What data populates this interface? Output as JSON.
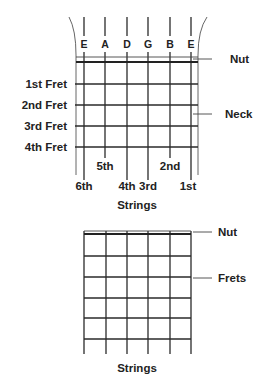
{
  "colors": {
    "line": "#2a2a2a",
    "text": "#222222",
    "background": "#ffffff"
  },
  "diagram1": {
    "string_names": [
      "E",
      "A",
      "D",
      "G",
      "B",
      "E"
    ],
    "string_x": [
      84,
      105,
      127,
      148,
      170,
      191
    ],
    "string_top": 17,
    "string_bottom": [
      180,
      158,
      180,
      180,
      158,
      180
    ],
    "neck_left": 76,
    "neck_right": 198,
    "neck_bottom": 175,
    "nut_y": [
      57,
      62
    ],
    "frets": [
      {
        "label": "1st Fret",
        "y": 84
      },
      {
        "label": "2nd Fret",
        "y": 105
      },
      {
        "label": "3rd Fret",
        "y": 126
      },
      {
        "label": "4th Fret",
        "y": 147
      }
    ],
    "callouts": [
      {
        "label": "Nut",
        "y": 59,
        "line_x1": 193,
        "line_x2": 212,
        "text_x": 230
      },
      {
        "label": "Neck",
        "y": 114,
        "line_x1": 193,
        "line_x2": 212,
        "text_x": 225
      }
    ],
    "string_numbers_upper": [
      {
        "label": "5th",
        "x": 105,
        "y": 170
      },
      {
        "label": "2nd",
        "x": 170,
        "y": 170
      }
    ],
    "string_numbers_lower": [
      {
        "label": "6th",
        "x": 84,
        "y": 190
      },
      {
        "label": "4th",
        "x": 127,
        "y": 190
      },
      {
        "label": "3rd",
        "x": 148,
        "y": 190
      },
      {
        "label": "1st",
        "x": 188,
        "y": 190
      }
    ],
    "axis_label": "Strings"
  },
  "diagram2": {
    "string_x": [
      84,
      106,
      127,
      148,
      170,
      191
    ],
    "string_top": 231,
    "string_bottom": 354,
    "nut_y": [
      231,
      234
    ],
    "fret_y": [
      256,
      277,
      298,
      318,
      339
    ],
    "callouts": [
      {
        "label": "Nut",
        "y": 232,
        "line_x1": 193,
        "line_x2": 212,
        "text_x": 218
      },
      {
        "label": "Frets",
        "y": 278,
        "line_x1": 193,
        "line_x2": 212,
        "text_x": 218
      }
    ],
    "axis_label": "Strings"
  }
}
